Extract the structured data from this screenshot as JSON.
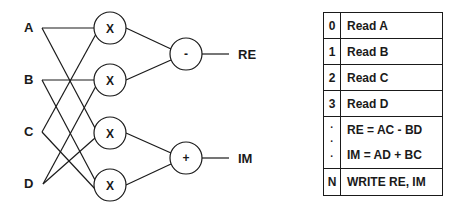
{
  "diagram": {
    "inputs": [
      {
        "label": "A",
        "x": 30,
        "y": 28
      },
      {
        "label": "B",
        "x": 30,
        "y": 80
      },
      {
        "label": "C",
        "x": 30,
        "y": 132
      },
      {
        "label": "D",
        "x": 30,
        "y": 184
      }
    ],
    "multipliers": [
      {
        "label": "X",
        "cx": 110,
        "cy": 28,
        "inputs": [
          "A",
          "C"
        ]
      },
      {
        "label": "X",
        "cx": 110,
        "cy": 80,
        "inputs": [
          "B",
          "D"
        ]
      },
      {
        "label": "X",
        "cx": 110,
        "cy": 133,
        "inputs": [
          "A",
          "D"
        ]
      },
      {
        "label": "X",
        "cx": 110,
        "cy": 185,
        "inputs": [
          "B",
          "C"
        ]
      }
    ],
    "operators": [
      {
        "label": "-",
        "cx": 186,
        "cy": 54,
        "output": "RE"
      },
      {
        "label": "+",
        "cx": 186,
        "cy": 158,
        "output": "IM"
      }
    ],
    "outputs": [
      {
        "label": "RE",
        "x": 240,
        "y": 54
      },
      {
        "label": "IM",
        "x": 240,
        "y": 158
      }
    ]
  },
  "program_table": {
    "rows": [
      {
        "index": "0",
        "instruction": "Read A"
      },
      {
        "index": "1",
        "instruction": "Read B"
      },
      {
        "index": "2",
        "instruction": "Read C"
      },
      {
        "index": "3",
        "instruction": "Read D"
      },
      {
        "index_dots": [
          "·",
          "·",
          "·"
        ],
        "instructions": [
          "RE = AC - BD",
          "IM = AD + BC"
        ]
      },
      {
        "index": "N",
        "instruction": "WRITE RE, IM"
      }
    ]
  }
}
